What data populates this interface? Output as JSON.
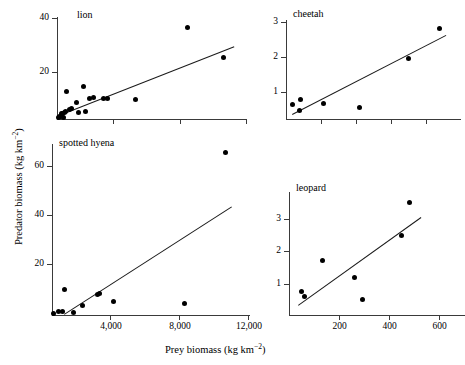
{
  "figure": {
    "xlabel_main": "Prey biomass (kg km",
    "xlabel_exp": "−2",
    "xlabel_tail": ")",
    "ylabel_main": "Predator biomass (kg km",
    "ylabel_exp": "−2",
    "ylabel_tail": ")"
  },
  "panels": {
    "lion": {
      "title": "lion",
      "yticks": [
        "40",
        "20"
      ],
      "xticks": [
        "",
        "",
        ""
      ]
    },
    "cheetah": {
      "title": "cheetah",
      "yticks": [
        "3",
        "2",
        "1"
      ],
      "xticks": [
        "",
        "",
        "",
        ""
      ]
    },
    "hyena": {
      "title": "spotted hyena",
      "yticks": [
        "60",
        "40",
        "20"
      ],
      "xticks": [
        "4,000",
        "8,000",
        "12,000"
      ]
    },
    "leopard": {
      "title": "leopard",
      "yticks": [
        "3",
        "2",
        "1"
      ],
      "xticks": [
        "200",
        "400",
        "600"
      ]
    }
  },
  "chart_data": [
    {
      "type": "scatter",
      "title": "lion",
      "xlabel": "Prey biomass (kg km-2)",
      "ylabel": "Predator biomass (kg km-2)",
      "xlim": [
        0,
        13500
      ],
      "ylim": [
        0,
        43
      ],
      "yticks": [
        20,
        40
      ],
      "xticks": [
        4000,
        8000,
        12000
      ],
      "grid": false,
      "points": [
        {
          "x": 120,
          "y": 0.8
        },
        {
          "x": 200,
          "y": 1.2
        },
        {
          "x": 260,
          "y": 1.0
        },
        {
          "x": 300,
          "y": 2.5
        },
        {
          "x": 380,
          "y": 2.2
        },
        {
          "x": 430,
          "y": 0.6
        },
        {
          "x": 520,
          "y": 2.8
        },
        {
          "x": 620,
          "y": 3.0
        },
        {
          "x": 700,
          "y": 11.5
        },
        {
          "x": 900,
          "y": 4.0
        },
        {
          "x": 1050,
          "y": 4.5
        },
        {
          "x": 1400,
          "y": 7.0
        },
        {
          "x": 1500,
          "y": 2.8
        },
        {
          "x": 1900,
          "y": 13.8
        },
        {
          "x": 2000,
          "y": 3.0
        },
        {
          "x": 2300,
          "y": 8.8
        },
        {
          "x": 2600,
          "y": 9.0
        },
        {
          "x": 3300,
          "y": 8.5
        },
        {
          "x": 3600,
          "y": 8.5
        },
        {
          "x": 5600,
          "y": 8.2
        },
        {
          "x": 9300,
          "y": 38.5
        },
        {
          "x": 11800,
          "y": 26.0
        }
      ],
      "fit_line": {
        "x1": 150,
        "y1": 1.5,
        "x2": 12600,
        "y2": 30.5
      }
    },
    {
      "type": "scatter",
      "title": "cheetah",
      "xlabel": "Prey biomass (kg km-2)",
      "ylabel": "Predator biomass (kg km-2)",
      "xlim": [
        0,
        1000
      ],
      "ylim": [
        0,
        3.3
      ],
      "yticks": [
        1,
        2,
        3
      ],
      "xticks": [
        200,
        400,
        600,
        800
      ],
      "grid": false,
      "points": [
        {
          "x": 35,
          "y": 0.5
        },
        {
          "x": 75,
          "y": 0.3
        },
        {
          "x": 85,
          "y": 0.66
        },
        {
          "x": 215,
          "y": 0.53
        },
        {
          "x": 420,
          "y": 0.4
        },
        {
          "x": 700,
          "y": 2.02
        },
        {
          "x": 875,
          "y": 3.02
        }
      ],
      "fit_line": {
        "x1": 35,
        "y1": 0.18,
        "x2": 915,
        "y2": 2.82
      }
    },
    {
      "type": "scatter",
      "title": "spotted hyena",
      "xlabel": "Prey biomass (kg km-2)",
      "ylabel": "Predator biomass (kg km-2)",
      "xlim": [
        0,
        13500
      ],
      "ylim": [
        0,
        70
      ],
      "yticks": [
        20,
        40,
        60
      ],
      "xticks": [
        4000,
        8000,
        12000
      ],
      "grid": false,
      "points": [
        {
          "x": 100,
          "y": 0.8
        },
        {
          "x": 420,
          "y": 1.5
        },
        {
          "x": 700,
          "y": 1.6
        },
        {
          "x": 850,
          "y": 10.3
        },
        {
          "x": 1450,
          "y": 1.0
        },
        {
          "x": 2100,
          "y": 3.8
        },
        {
          "x": 3100,
          "y": 8.3
        },
        {
          "x": 3250,
          "y": 8.8
        },
        {
          "x": 4200,
          "y": 5.5
        },
        {
          "x": 9000,
          "y": 4.8
        },
        {
          "x": 11800,
          "y": 66.5
        }
      ],
      "fit_line": {
        "x1": 800,
        "y1": 0.5,
        "x2": 12200,
        "y2": 44.5
      }
    },
    {
      "type": "scatter",
      "title": "leopard",
      "xlabel": "Prey biomass (kg km-2)",
      "ylabel": "Predator biomass (kg km-2)",
      "xlim": [
        0,
        700
      ],
      "ylim": [
        0,
        3.6
      ],
      "yticks": [
        1,
        2,
        3
      ],
      "xticks": [
        200,
        400,
        600
      ],
      "grid": false,
      "points": [
        {
          "x": 48,
          "y": 0.7
        },
        {
          "x": 62,
          "y": 0.55
        },
        {
          "x": 133,
          "y": 1.6
        },
        {
          "x": 258,
          "y": 1.1
        },
        {
          "x": 292,
          "y": 0.45
        },
        {
          "x": 443,
          "y": 2.32
        },
        {
          "x": 475,
          "y": 3.28
        }
      ],
      "fit_line": {
        "x1": 35,
        "y1": 0.3,
        "x2": 520,
        "y2": 2.87
      }
    }
  ]
}
